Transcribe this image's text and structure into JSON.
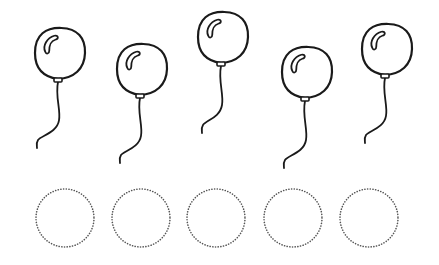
{
  "worksheet": {
    "background": "#ffffff",
    "line_color": "#1a1a1a",
    "dot_color": "#555555",
    "balloons": [
      {
        "id": 1,
        "cx": 60,
        "cy": 53,
        "rx": 25,
        "ry": 25,
        "knot_y": 79,
        "string_end": [
          37,
          148
        ]
      },
      {
        "id": 2,
        "cx": 142,
        "cy": 69,
        "rx": 25,
        "ry": 25,
        "knot_y": 95,
        "string_end": [
          120,
          163
        ]
      },
      {
        "id": 3,
        "cx": 223,
        "cy": 37,
        "rx": 25,
        "ry": 25,
        "knot_y": 63,
        "string_end": [
          202,
          133
        ]
      },
      {
        "id": 4,
        "cx": 307,
        "cy": 72,
        "rx": 25,
        "ry": 25,
        "knot_y": 98,
        "string_end": [
          284,
          168
        ]
      },
      {
        "id": 5,
        "cx": 387,
        "cy": 49,
        "rx": 25,
        "ry": 25,
        "knot_y": 75,
        "string_end": [
          365,
          143
        ]
      }
    ],
    "tracing_circles": [
      {
        "id": 1,
        "cx": 65,
        "cy": 218,
        "r": 29
      },
      {
        "id": 2,
        "cx": 141,
        "cy": 218,
        "r": 29
      },
      {
        "id": 3,
        "cx": 216,
        "cy": 218,
        "r": 29
      },
      {
        "id": 4,
        "cx": 293,
        "cy": 218,
        "r": 29
      },
      {
        "id": 5,
        "cx": 369,
        "cy": 218,
        "r": 29
      }
    ]
  }
}
